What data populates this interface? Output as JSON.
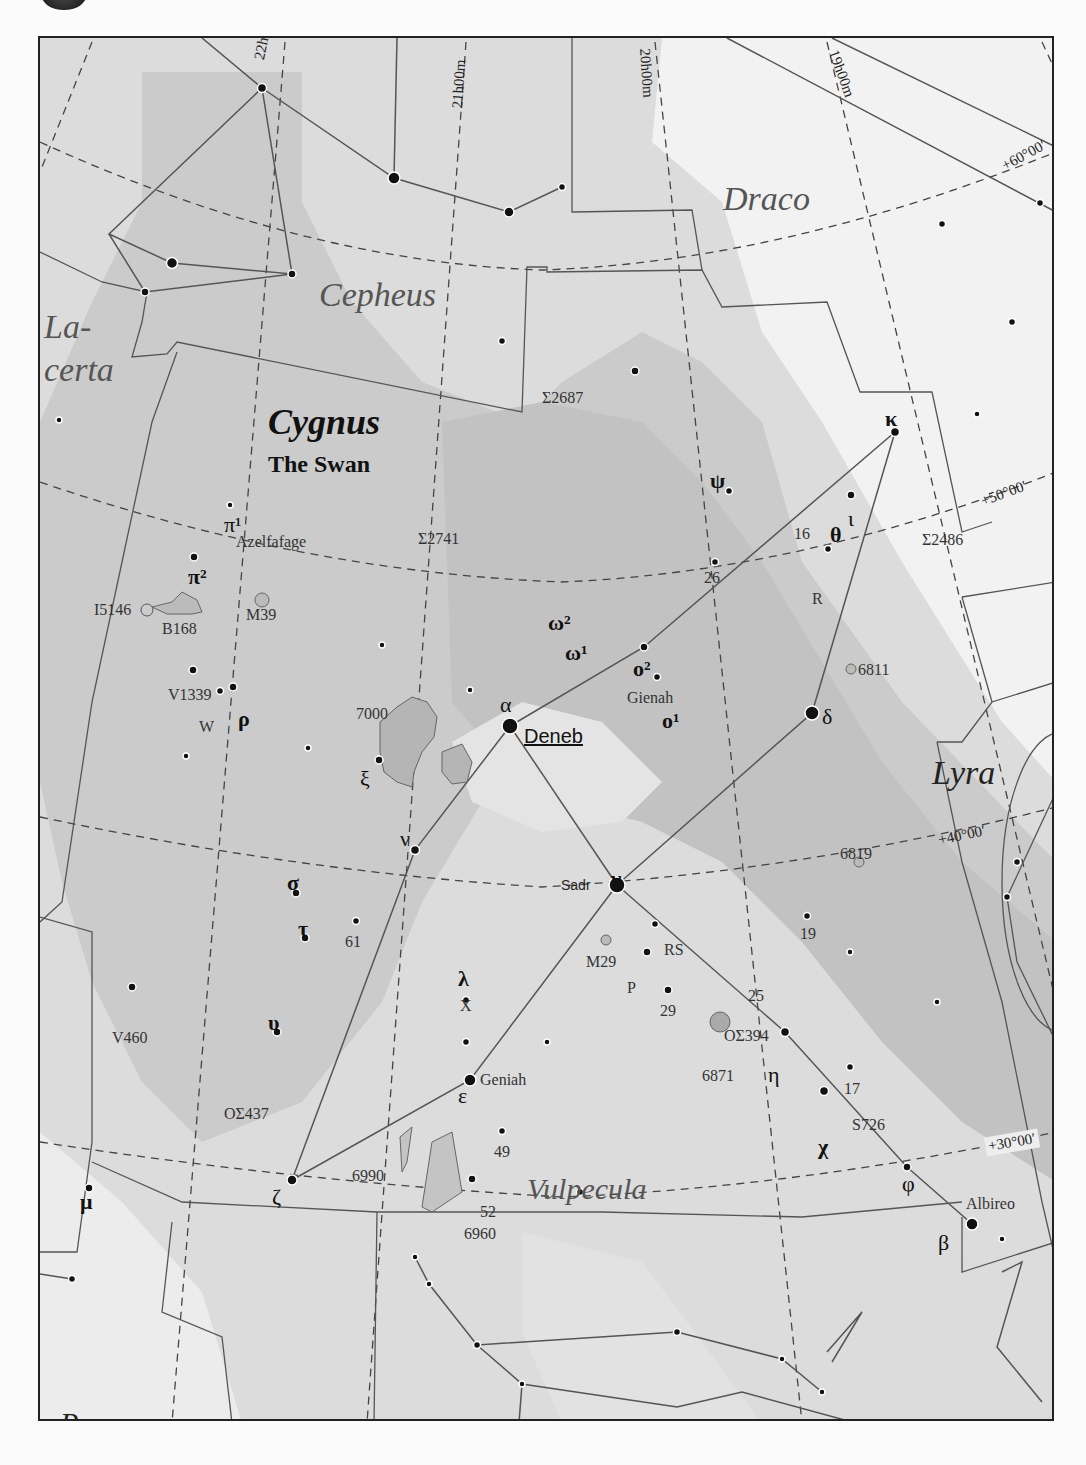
{
  "map": {
    "title": "Cygnus",
    "subtitle": "The Swan",
    "colors": {
      "milky_way_dark": "#c6c6c6",
      "milky_way_mid": "#d8d8d8",
      "sky_light": "#e6e6e6",
      "outside": "#f4f4f4",
      "lines": "#555555",
      "stars": "#111111"
    },
    "constellations": {
      "cepheus": "Cepheus",
      "draco": "Draco",
      "lacerta_1": "La-",
      "lacerta_2": "certa",
      "lyra": "Lyra",
      "vulpecula": "Vulpecula",
      "pegasus": "Pegasus"
    },
    "ra_labels": {
      "ra22": "22h00m",
      "ra21": "21h00m",
      "ra20": "20h00m",
      "ra19": "19h00m"
    },
    "dec_labels": {
      "dec60": "+60°00′",
      "dec50": "+50°00′",
      "dec40": "+40°00′",
      "dec30": "+30°00′"
    },
    "stars": {
      "alpha": "α",
      "deneb": "Deneb",
      "gamma": "γ",
      "sadr": "Sadr",
      "delta": "δ",
      "epsilon": "ε",
      "geniah": "Geniah",
      "beta": "β",
      "albireo": "Albireo",
      "kappa": "κ",
      "iota": "ι",
      "theta": "θ",
      "psi": "ψ",
      "nu": "ν",
      "xi": "ξ",
      "sigma": "σ",
      "tau": "τ",
      "upsilon": "υ",
      "zeta": "ζ",
      "lambda": "λ",
      "eta": "η",
      "chi": "χ",
      "phi": "φ",
      "mu": "μ",
      "rho": "ρ",
      "pi1": "π¹",
      "azelfafage": "Azelfafage",
      "pi2": "π²",
      "omega2": "ω²",
      "omega1": "ω¹",
      "o2": "o²",
      "gienah": "Gienah",
      "o1": "o¹",
      "n16": "16",
      "n19": "19",
      "n25": "25",
      "n26": "26",
      "n29": "29",
      "n17": "17",
      "n49": "49",
      "n52": "52",
      "n61": "61",
      "R": "R",
      "RS": "RS",
      "P": "P",
      "W": "W",
      "X": "X",
      "V1339": "V1339",
      "V460": "V460",
      "S726": "S726"
    },
    "objects": {
      "s2687": "Σ2687",
      "s2741": "Σ2741",
      "s2486": "Σ2486",
      "os394": "OΣ394",
      "os437": "OΣ437",
      "m39": "M39",
      "m29": "M29",
      "i5146": "I5146",
      "b168": "B168",
      "n7000": "7000",
      "n6811": "6811",
      "n6819": "6819",
      "n6871": "6871",
      "n6990": "6990",
      "n6960": "6960"
    }
  }
}
